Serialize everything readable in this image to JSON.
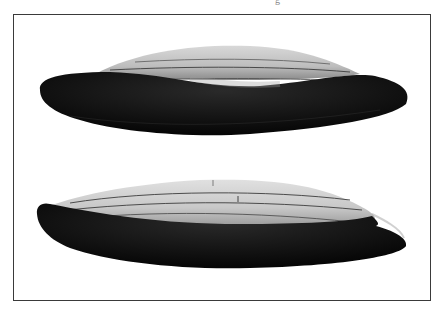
{
  "image": {
    "kind": "photographic plate",
    "caption_fragment": "g",
    "frame_color": "#3a3a3a",
    "background": "#ffffff"
  },
  "specimens": [
    {
      "name": "upper-specimen",
      "view": "side profile, dark lower half, pale ridged upper dome",
      "dome_ridge_lines": 3
    },
    {
      "name": "lower-specimen",
      "view": "side profile, pale striated upper dome, dark lower half with rim step at right",
      "dome_ridge_lines": 3
    }
  ],
  "colors": {
    "dark_body": "#0d0d0d",
    "pale_dome": "#c9c9c9",
    "ridge_line": "#3c3c3c"
  }
}
